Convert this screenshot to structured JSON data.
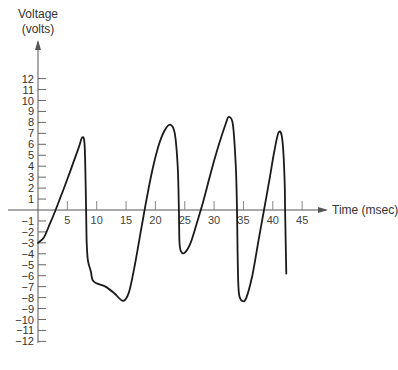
{
  "chart_data": {
    "type": "line",
    "title": "",
    "xlabel": "Time (msec)",
    "ylabel_line1": "Voltage",
    "ylabel_line2": "(volts)",
    "x_ticks": [
      5,
      10,
      15,
      20,
      25,
      30,
      35,
      40,
      45
    ],
    "x_tick_labels": [
      "5",
      "10",
      "15",
      "20",
      "25",
      "30",
      "35",
      "40",
      "45"
    ],
    "y_ticks": [
      12,
      11,
      10,
      9,
      8,
      7,
      6,
      5,
      4,
      3,
      2,
      1,
      -1,
      -2,
      -3,
      -4,
      -5,
      -6,
      -7,
      -8,
      -9,
      -10,
      -11,
      -12
    ],
    "y_tick_labels": [
      "12",
      "11",
      "10",
      "9",
      "8",
      "7",
      "6",
      "5",
      "4",
      "3",
      "2",
      "1",
      "−1",
      "−2",
      "−3",
      "−4",
      "−5",
      "−6",
      "−7",
      "−8",
      "−9",
      "−10",
      "−11",
      "−12"
    ],
    "xlim": [
      0,
      48
    ],
    "ylim": [
      -12,
      12
    ],
    "grid": false,
    "legend": "none",
    "series": [
      {
        "name": "Voltage",
        "points": [
          [
            0,
            -3
          ],
          [
            1,
            -2.5
          ],
          [
            2,
            -1.3
          ],
          [
            3,
            0
          ],
          [
            4,
            1.4
          ],
          [
            5,
            2.8
          ],
          [
            6,
            4.3
          ],
          [
            7,
            5.8
          ],
          [
            7.5,
            6.6
          ],
          [
            7.9,
            6.2
          ],
          [
            8.1,
            3
          ],
          [
            8.2,
            0
          ],
          [
            8.3,
            -3
          ],
          [
            8.5,
            -4.6
          ],
          [
            9,
            -5.6
          ],
          [
            9.3,
            -6.4
          ],
          [
            10,
            -6.7
          ],
          [
            11.5,
            -7
          ],
          [
            13,
            -7.6
          ],
          [
            14.5,
            -8.3
          ],
          [
            15.5,
            -7.5
          ],
          [
            16.5,
            -5
          ],
          [
            17.5,
            -2
          ],
          [
            18.5,
            1
          ],
          [
            19.5,
            3.7
          ],
          [
            20.5,
            5.8
          ],
          [
            21.5,
            7.2
          ],
          [
            22.5,
            7.8
          ],
          [
            23.3,
            7
          ],
          [
            23.8,
            4
          ],
          [
            24,
            0
          ],
          [
            24.1,
            -3
          ],
          [
            24.4,
            -3.8
          ],
          [
            25,
            -3.9
          ],
          [
            26,
            -3
          ],
          [
            27,
            -1.3
          ],
          [
            28,
            0.5
          ],
          [
            29,
            2.5
          ],
          [
            30,
            4.5
          ],
          [
            31,
            6.3
          ],
          [
            32,
            7.9
          ],
          [
            32.5,
            8.5
          ],
          [
            33.2,
            7.8
          ],
          [
            33.7,
            4
          ],
          [
            33.9,
            0
          ],
          [
            34,
            -4
          ],
          [
            34.2,
            -7.5
          ],
          [
            34.8,
            -8.3
          ],
          [
            35.5,
            -8
          ],
          [
            36.5,
            -6
          ],
          [
            37.5,
            -3
          ],
          [
            38.5,
            0
          ],
          [
            39.5,
            3
          ],
          [
            40.3,
            5.5
          ],
          [
            41,
            7.1
          ],
          [
            41.6,
            6.5
          ],
          [
            42,
            3
          ],
          [
            42.1,
            0
          ],
          [
            42.2,
            -3
          ],
          [
            42.3,
            -5.8
          ]
        ]
      }
    ]
  }
}
